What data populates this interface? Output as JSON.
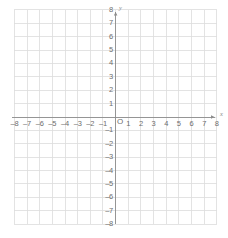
{
  "figure": {
    "background_color": "#ffffff"
  },
  "chart_data": {
    "type": "scatter",
    "title": "",
    "xlabel": "x",
    "ylabel": "y",
    "xlim": [
      -8,
      8
    ],
    "ylim": [
      -8,
      8
    ],
    "grid": true,
    "grid_step": 1,
    "legend": "none",
    "series": [],
    "x_tick_labels": [
      "–8",
      "–7",
      "–6",
      "–5",
      "–4",
      "–3",
      "–2",
      "–1",
      "1",
      "2",
      "3",
      "4",
      "5",
      "6",
      "7",
      "8"
    ],
    "x_tick_values": [
      -8,
      -7,
      -6,
      -5,
      -4,
      -3,
      -2,
      -1,
      1,
      2,
      3,
      4,
      5,
      6,
      7,
      8
    ],
    "y_tick_labels": [
      "8",
      "7",
      "6",
      "5",
      "4",
      "3",
      "2",
      "1",
      "–1",
      "–2",
      "–3",
      "–4",
      "–5",
      "–6",
      "–7",
      "–8"
    ],
    "y_tick_values": [
      8,
      7,
      6,
      5,
      4,
      3,
      2,
      1,
      -1,
      -2,
      -3,
      -4,
      -5,
      -6,
      -7,
      -8
    ],
    "origin_label": "O",
    "colors": {
      "gridline": "#dcdcdc",
      "axis": "#8c8c8c",
      "label": "#6e6e6e",
      "axis_name": "#8a8a8a"
    }
  },
  "axes": {
    "x_name": "x",
    "y_name": "y",
    "origin": "O"
  }
}
